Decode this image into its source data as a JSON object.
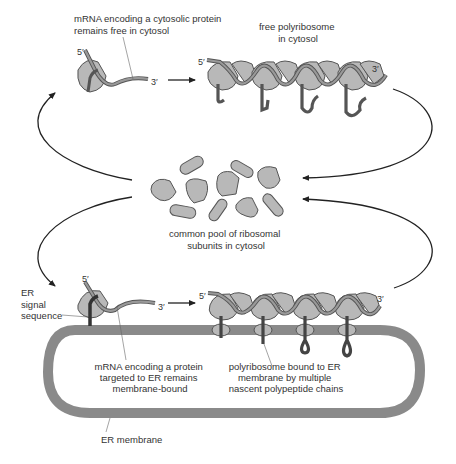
{
  "labels": {
    "cytosolic_mrna": [
      "mRNA encoding a cytosolic protein",
      "remains free in cytosol"
    ],
    "free_polyribosome": [
      "free polyribosome",
      "in cytosol"
    ],
    "ribosome_pool": [
      "common pool of ribosomal",
      "subunits in cytosol"
    ],
    "er_signal": [
      "ER",
      "signal",
      "sequence"
    ],
    "er_mrna": [
      "mRNA encoding a protein",
      "targeted to ER remains",
      "membrane-bound"
    ],
    "bound_polyribosome": [
      "polyribosome bound to ER",
      "membrane by multiple",
      "nascent polypeptide chains"
    ],
    "er_membrane": "ER membrane",
    "five_prime": "5′",
    "three_prime": "3′"
  },
  "colors": {
    "ribosome_fill": "#b8b8b8",
    "ribosome_stroke": "#555555",
    "mrna": "#8f8f8f",
    "membrane": "#8a8a8a",
    "arrow": "#222222",
    "text": "#333333"
  }
}
